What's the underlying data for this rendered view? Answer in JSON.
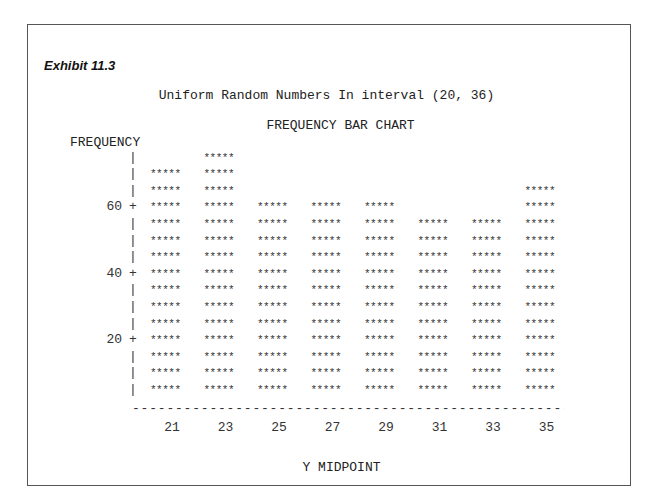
{
  "exhibit": "Exhibit 11.3",
  "chart_data": {
    "type": "bar",
    "title": "Uniform Random Numbers In interval (20, 36)",
    "subtitle": "FREQUENCY BAR CHART",
    "ylabel": "FREQUENCY",
    "xlabel": "Y MIDPOINT",
    "categories": [
      "21",
      "23",
      "25",
      "27",
      "29",
      "31",
      "33",
      "35"
    ],
    "values": [
      70,
      75,
      60,
      60,
      60,
      55,
      55,
      65
    ],
    "yticks": [
      "20",
      "40",
      "60"
    ],
    "ylim": [
      0,
      75
    ],
    "symbol": "*****",
    "unit_per_row": 5,
    "grid": false,
    "legend": "none"
  }
}
